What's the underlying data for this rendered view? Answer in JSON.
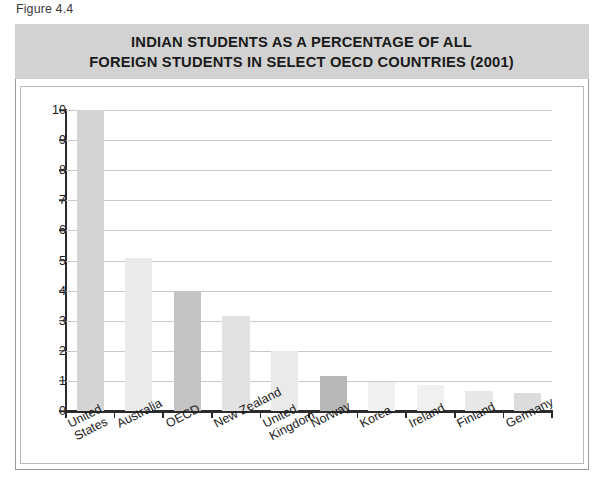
{
  "figure": {
    "caption": "Figure 4.4"
  },
  "chart_data": {
    "type": "bar",
    "title": "INDIAN STUDENTS AS A PERCENTAGE OF ALL\nFOREIGN STUDENTS IN SELECT OECD COUNTRIES (2001)",
    "xlabel": "",
    "ylabel": "",
    "categories": [
      "United\nStates",
      "Australia",
      "OECD",
      "New Zealand",
      "United\nKingdom",
      "Norway",
      "Korea",
      "Ireland",
      "Finland",
      "Germany"
    ],
    "values": [
      10.0,
      5.1,
      4.0,
      3.15,
      2.0,
      1.15,
      0.95,
      0.85,
      0.65,
      0.6
    ],
    "bar_colors": [
      "#d4d4d4",
      "#eaeaea",
      "#c4c4c4",
      "#e2e2e2",
      "#eaeaea",
      "#b8b8b8",
      "#f0f0f0",
      "#f0f0f0",
      "#e8e8e8",
      "#dcdcdc"
    ],
    "ylim": [
      0,
      10
    ],
    "yticks": [
      0,
      1,
      2,
      3,
      4,
      5,
      6,
      7,
      8,
      9,
      10
    ],
    "ytick_labels": [
      "0",
      "1",
      "2",
      "3",
      "4",
      "5",
      "6",
      "7",
      "8",
      "9",
      "10"
    ],
    "grid": true,
    "legend": "none",
    "title_band_color": "#d2d2d2",
    "plot_background": "#ffffff",
    "axis_color": "#2b2b2b",
    "grid_color": "#c9c9c9"
  }
}
